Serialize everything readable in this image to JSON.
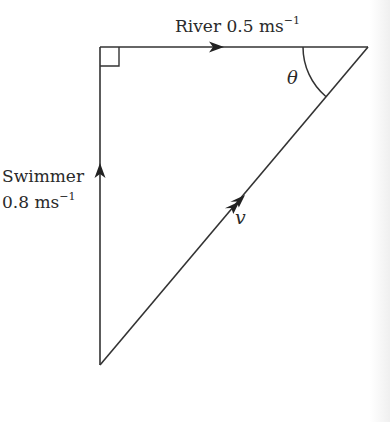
{
  "diagram": {
    "type": "vector-triangle",
    "labels": {
      "river": {
        "name": "River",
        "value": "0.5",
        "unit": "ms",
        "exp": "−1"
      },
      "swimmer": {
        "name": "Swimmer",
        "value": "0.8",
        "unit": "ms",
        "exp": "−1"
      },
      "angle": "θ",
      "resultant": "v"
    },
    "vertices": {
      "top_left": [
        100,
        47
      ],
      "top_right": [
        368,
        47
      ],
      "bottom": [
        100,
        365
      ]
    },
    "right_angle_at": "top_left",
    "colors": {
      "stroke": "#333333",
      "text": "#2a2a2a",
      "background": "#ffffff"
    }
  }
}
